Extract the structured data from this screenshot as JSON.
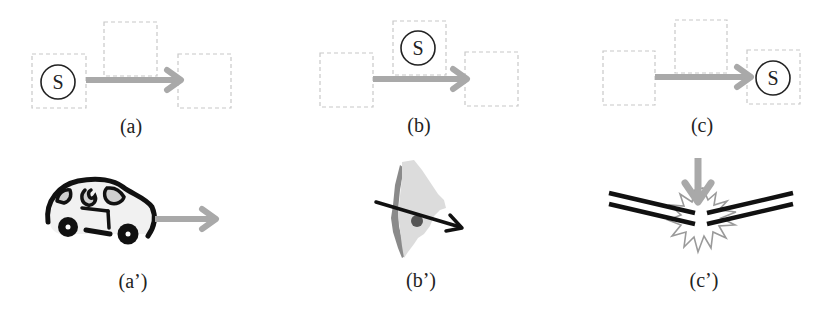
{
  "figure": {
    "colors": {
      "dashed_box": "#c8c8c8",
      "arrow_gray": "#a9a9a9",
      "circle_stroke": "#222222",
      "ink": "#111111",
      "country_fill": "#dcdcdc",
      "country_shadow": "#8a8a8a",
      "starburst_stroke": "#9a9a9a"
    },
    "panels_top": [
      {
        "id": "a",
        "label": "(a)",
        "symbol": "S",
        "symbol_position": "left-box"
      },
      {
        "id": "b",
        "label": "(b)",
        "symbol": "S",
        "symbol_position": "top-middle-box"
      },
      {
        "id": "c",
        "label": "(c)",
        "symbol": "S",
        "symbol_position": "right-box"
      }
    ],
    "panels_bottom": [
      {
        "id": "a-prime",
        "label": "(a’)",
        "icon": "car-icon",
        "description": "car moving right"
      },
      {
        "id": "b-prime",
        "label": "(b’)",
        "icon": "country-map-icon",
        "description": "arrow passing through a country shape"
      },
      {
        "id": "c-prime",
        "label": "(c’)",
        "icon": "breaking-stick-icon",
        "description": "stick breaking under downward force"
      }
    ]
  }
}
